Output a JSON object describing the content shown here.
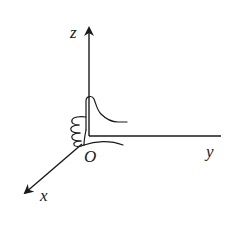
{
  "diagram": {
    "type": "3d-coordinate-system-right-hand-rule",
    "origin_label": "O",
    "axes": [
      {
        "name": "x",
        "label": "x",
        "direction": "down-left (toward viewer)"
      },
      {
        "name": "y",
        "label": "y",
        "direction": "right"
      },
      {
        "name": "z",
        "label": "z",
        "direction": "up"
      }
    ],
    "illustration": "right hand thumb-up gesture at origin, thumb along z-axis, fingers curling from x toward y",
    "colors": {
      "stroke": "#1a1a1a",
      "background": "#ffffff"
    }
  }
}
